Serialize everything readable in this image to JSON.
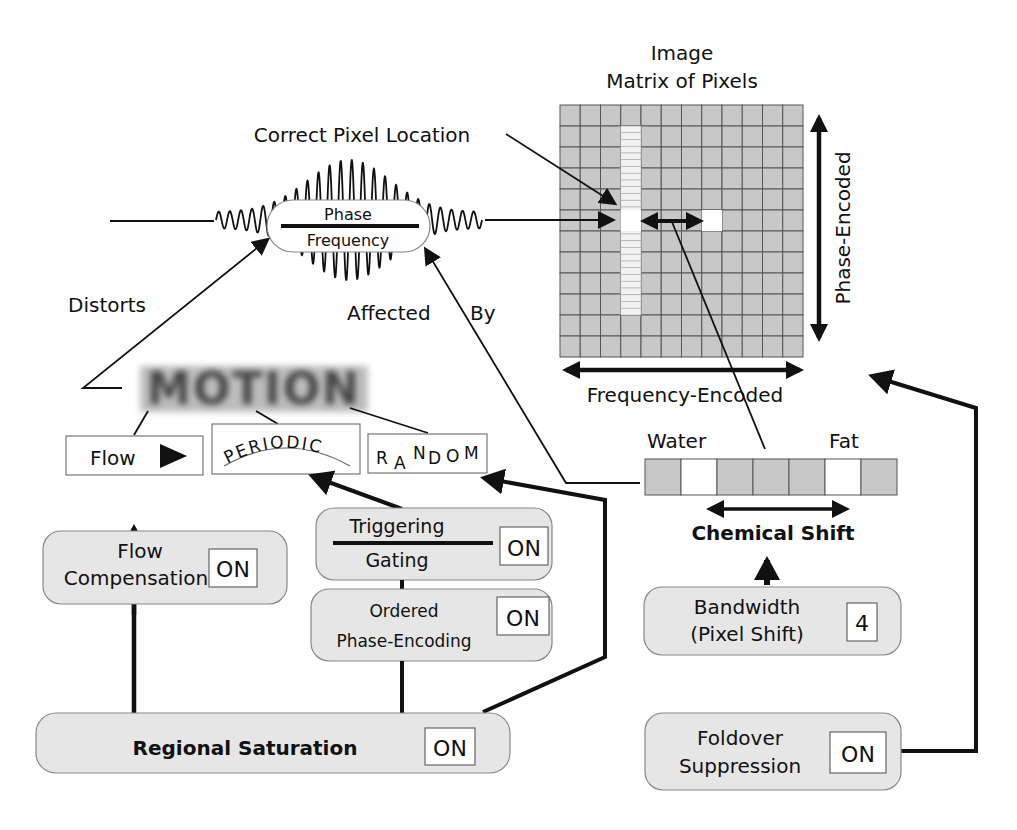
{
  "matrix": {
    "title_line1": "Image",
    "title_line2": "Matrix of Pixels",
    "axis_phase": "Phase-Encoded",
    "axis_frequency": "Frequency-Encoded",
    "rows": 12,
    "cols": 12
  },
  "signal": {
    "phase_label": "Phase",
    "frequency_label": "Frequency",
    "correct_pixel_label": "Correct Pixel Location"
  },
  "relations": {
    "distorts": "Distorts",
    "affected": "Affected",
    "by": "By"
  },
  "motion": {
    "title": "MOTION",
    "types": {
      "flow": "Flow",
      "periodic": "PERIODIC",
      "random": "RANDOM"
    }
  },
  "controls": {
    "flow_comp": {
      "line1": "Flow",
      "line2": "Compensation",
      "value": "ON"
    },
    "triggering": {
      "line1": "Triggering",
      "line2": "Gating",
      "value": "ON"
    },
    "ordered": {
      "line1": "Ordered",
      "line2": "Phase-Encoding",
      "value": "ON"
    },
    "regional": {
      "label": "Regional Saturation",
      "value": "ON"
    },
    "bandwidth": {
      "line1": "Bandwidth",
      "line2": "(Pixel Shift)",
      "value": "4"
    },
    "foldover": {
      "line1": "Foldover",
      "line2": "Suppression",
      "value": "ON"
    }
  },
  "chemical": {
    "water": "Water",
    "fat": "Fat",
    "label": "Chemical Shift"
  },
  "colors": {
    "pixel_gray": "#c8c8c8",
    "box_gray": "#e6e6e6",
    "ink": "#111111"
  }
}
